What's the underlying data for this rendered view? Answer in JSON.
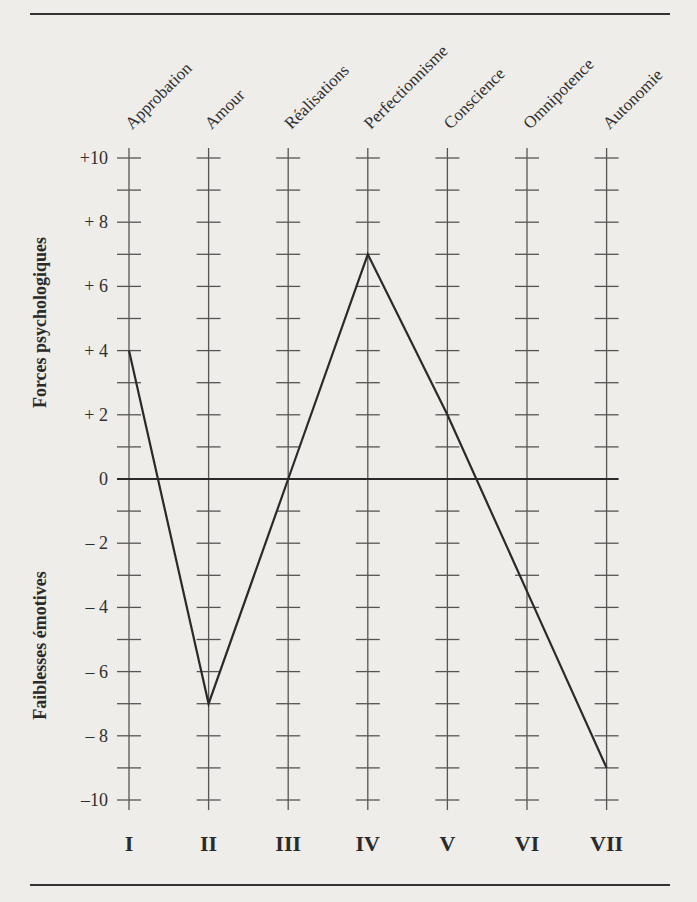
{
  "chart_data": {
    "type": "line",
    "title": "",
    "categories": [
      "Approbation",
      "Amour",
      "Réalisations",
      "Perfectionnisme",
      "Conscience",
      "Omnipotence",
      "Autonomie"
    ],
    "roman_numerals": [
      "I",
      "II",
      "III",
      "IV",
      "V",
      "VI",
      "VII"
    ],
    "series": [
      {
        "name": "Profil",
        "values": [
          4,
          -7,
          0,
          7,
          2,
          -3.5,
          -9
        ]
      }
    ],
    "ylim": [
      -10,
      10
    ],
    "yticks": [
      10,
      8,
      6,
      4,
      2,
      0,
      -2,
      -4,
      -6,
      -8,
      -10
    ],
    "ytick_labels": [
      "+10",
      "+ 8",
      "+ 6",
      "+ 4",
      "+ 2",
      "0",
      "– 2",
      "– 4",
      "– 6",
      "– 8",
      "–10"
    ],
    "ylabel_positive": "Forces psychologiques",
    "ylabel_negative": "Faiblesses émotives",
    "xlabel": "",
    "grid": false,
    "legend": null,
    "zero_line": true
  },
  "colors": {
    "background": "#eeede9",
    "ink": "#2a2a2a",
    "axis": "#555555"
  }
}
